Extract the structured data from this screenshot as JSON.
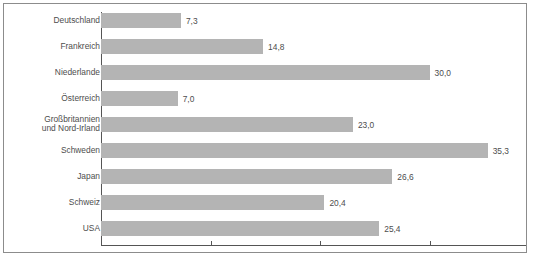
{
  "chart_data": {
    "type": "bar",
    "orientation": "horizontal",
    "title": "",
    "subtitle": "",
    "xlabel": "",
    "ylabel": "",
    "categories": [
      "Deutschland",
      "Frankreich",
      "Niederlande",
      "Österreich",
      "Großbritannien\nund Nord-Irland",
      "Schweden",
      "Japan",
      "Schweiz",
      "USA"
    ],
    "values": [
      7.3,
      14.8,
      30.0,
      7.0,
      23.0,
      35.3,
      26.6,
      20.4,
      25.4
    ],
    "value_labels": [
      "7,3",
      "14,8",
      "30,0",
      "7,0",
      "23,0",
      "35,3",
      "26,6",
      "20,4",
      "25,4"
    ],
    "xlim": [
      0,
      38.8
    ],
    "ylim": null,
    "xticks": [
      0,
      10,
      20,
      30
    ],
    "xtick_labels": [
      "",
      "",
      "",
      ""
    ],
    "grid": false,
    "legend": null,
    "legend_position": "none",
    "bar_color": "#b4b4b4",
    "axis_color": "#555555",
    "text_color": "#4d4d4d",
    "frame_border_color": "#8c8c8c",
    "background_color": "#ffffff",
    "decimal_separator": ","
  }
}
